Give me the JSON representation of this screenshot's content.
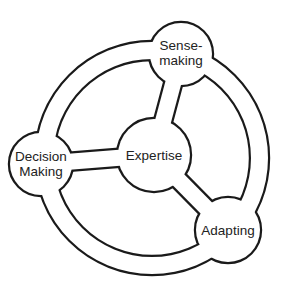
{
  "diagram": {
    "type": "cycle-with-hub",
    "colors": {
      "line": "#1a1a1a",
      "fill": "#ffffff",
      "text": "#222222"
    },
    "hub": {
      "id": "expertise",
      "label": "Expertise",
      "cx": 154,
      "cy": 155,
      "r": 36
    },
    "nodes": [
      {
        "id": "sensemaking",
        "label": "Sense-\nmaking",
        "cx": 181,
        "cy": 54,
        "r": 31
      },
      {
        "id": "adapting",
        "label": "Adapting",
        "cx": 228,
        "cy": 230,
        "r": 32
      },
      {
        "id": "decision-making",
        "label": "Decision\nMaking",
        "cx": 41,
        "cy": 164,
        "r": 31
      }
    ],
    "ring": {
      "cx": 152,
      "cy": 158,
      "r_outer": 116,
      "r_inner": 99
    },
    "edges": [
      {
        "from": "expertise",
        "to": "sensemaking"
      },
      {
        "from": "expertise",
        "to": "adapting"
      },
      {
        "from": "expertise",
        "to": "decision-making"
      }
    ]
  }
}
